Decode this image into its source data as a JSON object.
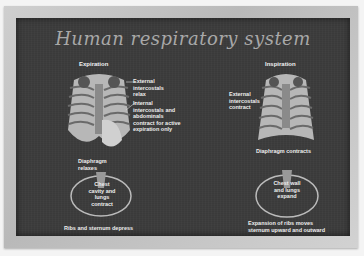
{
  "poster": {
    "title": "Human respiratory system",
    "expiration": {
      "heading": "Expiration",
      "external_label": "External intercostals relax",
      "internal_label": "Internal intercostals and abdominals contract for active expiration only",
      "diaphragm_label": "Diaphragm relaxes",
      "cross_section_label": "Chest cavity and lungs contract",
      "bottom_label": "Ribs and sternum depress"
    },
    "inspiration": {
      "heading": "Inspiration",
      "external_label": "External intercostals contract",
      "diaphragm_label": "Diaphragm contracts",
      "cross_section_label": "Chest wall and lungs expand",
      "bottom_label": "Expansion of ribs moves sternum upward and outward"
    }
  }
}
